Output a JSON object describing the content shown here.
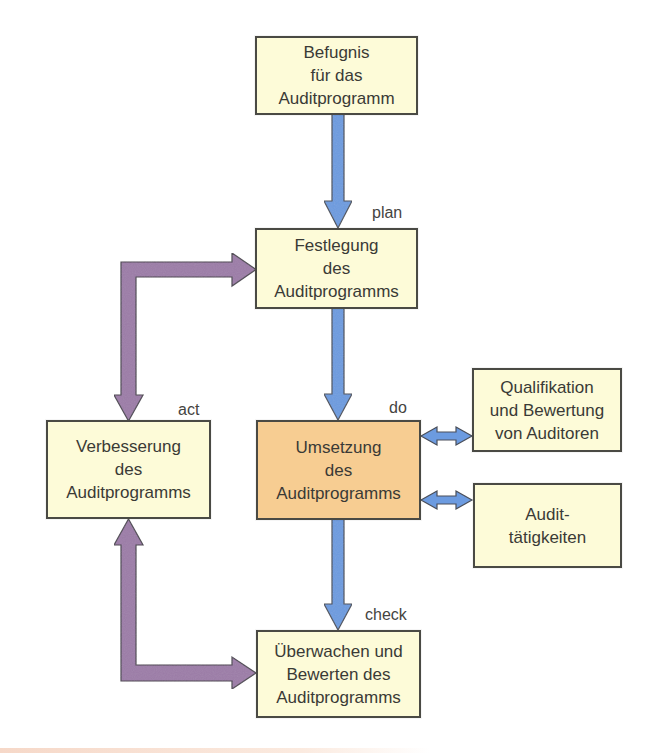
{
  "diagram": {
    "type": "pdca-flowchart",
    "colors": {
      "box_fill": "#fdfbd8",
      "box_active_fill": "#f7cd92",
      "box_border": "#4a4a44",
      "flow_arrow": "#6c9be0",
      "feedback_arrow": "#9c7ba8",
      "text": "#3a3a36"
    },
    "nodes": {
      "authority": {
        "lines": [
          "Befugnis",
          "für das",
          "Auditprogramm"
        ]
      },
      "establish": {
        "lines": [
          "Festlegung",
          "des",
          "Auditprogramms"
        ]
      },
      "implement": {
        "lines": [
          "Umsetzung",
          "des",
          "Auditprogramms"
        ]
      },
      "monitor": {
        "lines": [
          "Überwachen und",
          "Bewerten des",
          "Auditprogramms"
        ]
      },
      "improve": {
        "lines": [
          "Verbesserung",
          "des",
          "Auditprogramms"
        ]
      },
      "competence": {
        "lines": [
          "Qualifikation",
          "und Bewertung",
          "von Auditoren"
        ]
      },
      "activities": {
        "lines": [
          "Audit-",
          "tätigkeiten"
        ]
      }
    },
    "phases": {
      "plan": "plan",
      "do": "do",
      "check": "check",
      "act": "act"
    },
    "edges": [
      {
        "from": "authority",
        "to": "establish",
        "style": "flow"
      },
      {
        "from": "establish",
        "to": "implement",
        "style": "flow"
      },
      {
        "from": "implement",
        "to": "monitor",
        "style": "flow"
      },
      {
        "from": "monitor",
        "to": "improve",
        "style": "feedback"
      },
      {
        "from": "improve",
        "to": "establish",
        "style": "feedback"
      },
      {
        "from": "implement",
        "to": "competence",
        "style": "bidirectional"
      },
      {
        "from": "implement",
        "to": "activities",
        "style": "bidirectional"
      }
    ]
  }
}
